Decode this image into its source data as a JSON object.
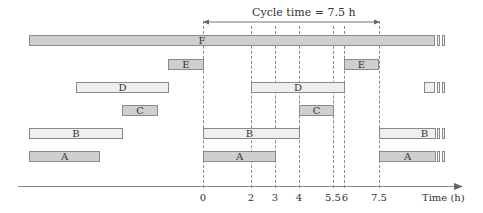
{
  "diagram": {
    "cycle_label": "Cycle time = 7.5 h",
    "axis_label": "Time (h)",
    "ticks": [
      "0",
      "2",
      "3",
      "4",
      "5.5",
      "6",
      "7.5"
    ],
    "colors": {
      "dark_bar": "#cfcfcf",
      "light_bar": "#efefef",
      "stroke": "#8a8a8a"
    },
    "rows": {
      "F": {
        "label": "F"
      },
      "E": {
        "label": "E"
      },
      "D": {
        "label": "D"
      },
      "C": {
        "label": "C"
      },
      "B": {
        "label": "B"
      },
      "A": {
        "label": "A"
      }
    },
    "bars": [
      {
        "row": "F",
        "segment": "continuous",
        "start": "before",
        "end": "beyond"
      },
      {
        "row": "E",
        "segment": "previous",
        "end": 0
      },
      {
        "row": "E",
        "segment": "current",
        "start": 6,
        "end": 7.5
      },
      {
        "row": "D",
        "segment": "previous"
      },
      {
        "row": "D",
        "segment": "current",
        "start": 2,
        "end": 6
      },
      {
        "row": "C",
        "segment": "previous"
      },
      {
        "row": "C",
        "segment": "current",
        "start": 4,
        "end": 5.5
      },
      {
        "row": "B",
        "segment": "previous"
      },
      {
        "row": "B",
        "segment": "current",
        "start": 0,
        "end": 4
      },
      {
        "row": "B",
        "segment": "next",
        "start": 7.5
      },
      {
        "row": "A",
        "segment": "previous"
      },
      {
        "row": "A",
        "segment": "current",
        "start": 0,
        "end": 3
      },
      {
        "row": "A",
        "segment": "next",
        "start": 7.5
      }
    ]
  }
}
